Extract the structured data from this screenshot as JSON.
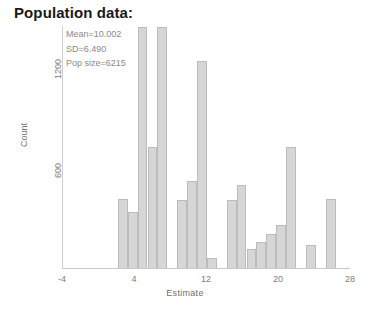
{
  "title": "Population data:",
  "annotation": {
    "mean": "Mean=10.002",
    "sd": "SD=6.490",
    "pop_size": "Pop size=6215"
  },
  "axes": {
    "xlabel": "Estimate",
    "ylabel": "Count",
    "xticks": [
      "-4",
      "4",
      "12",
      "20",
      "28"
    ],
    "yticks": [
      "600",
      "1200"
    ]
  },
  "colors": {
    "bar_fill": "#d6d6d6",
    "bar_edge": "#bcbcbc",
    "title": "#1a1a1a",
    "axis_text": "#7d7d7d"
  },
  "chart_data": {
    "type": "bar",
    "title": "Population data:",
    "xlabel": "Estimate",
    "ylabel": "Count",
    "xlim": [
      -4,
      28
    ],
    "ylim": [
      0,
      1400
    ],
    "xticks": [
      -4,
      4,
      12,
      20,
      28
    ],
    "yticks": [
      600,
      1200
    ],
    "grid": false,
    "legend": null,
    "bin_width": 1.1,
    "annotations": [
      "Mean=10.002",
      "SD=6.490",
      "Pop size=6215"
    ],
    "bins": [
      {
        "x": 2.2,
        "value": 400
      },
      {
        "x": 3.3,
        "value": 320
      },
      {
        "x": 4.4,
        "value": 1390
      },
      {
        "x": 5.5,
        "value": 700
      },
      {
        "x": 6.6,
        "value": 1390
      },
      {
        "x": 8.8,
        "value": 390
      },
      {
        "x": 9.9,
        "value": 500
      },
      {
        "x": 11.0,
        "value": 1190
      },
      {
        "x": 12.1,
        "value": 60
      },
      {
        "x": 14.3,
        "value": 390
      },
      {
        "x": 15.4,
        "value": 480
      },
      {
        "x": 16.5,
        "value": 110
      },
      {
        "x": 17.6,
        "value": 150
      },
      {
        "x": 18.7,
        "value": 195
      },
      {
        "x": 19.8,
        "value": 250
      },
      {
        "x": 20.9,
        "value": 700
      },
      {
        "x": 23.1,
        "value": 130
      },
      {
        "x": 25.3,
        "value": 400
      }
    ]
  }
}
